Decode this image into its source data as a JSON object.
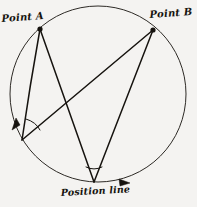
{
  "figure": {
    "background_color": "#f4f3f1",
    "ink_color": "#16130f",
    "labels": {
      "point_a": "Point A",
      "point_b": "Point B",
      "position_line": "Position line"
    },
    "geometry": {
      "circle": {
        "cx": 98,
        "cy": 94,
        "r": 88
      },
      "vertices": {
        "point_a": {
          "x": 40,
          "y": 29,
          "marker": "filled-dot"
        },
        "point_b": {
          "x": 153,
          "y": 30,
          "marker": "filled-dot"
        },
        "left_observer": {
          "x": 22,
          "y": 140,
          "marker": "none"
        },
        "bottom_observer": {
          "x": 94,
          "y": 182,
          "marker": "none"
        }
      },
      "chords": [
        {
          "from": "point_a",
          "to": "left_observer"
        },
        {
          "from": "point_a",
          "to": "bottom_observer"
        },
        {
          "from": "point_b",
          "to": "left_observer"
        },
        {
          "from": "point_b",
          "to": "bottom_observer"
        }
      ],
      "angle_arcs": [
        {
          "at": "left_observer"
        },
        {
          "at": "bottom_observer"
        }
      ],
      "arc_arrows": [
        {
          "at_x": 14,
          "at_y": 125,
          "direction": "down-left"
        },
        {
          "at_x": 126,
          "at_y": 183,
          "direction": "right"
        }
      ]
    }
  }
}
